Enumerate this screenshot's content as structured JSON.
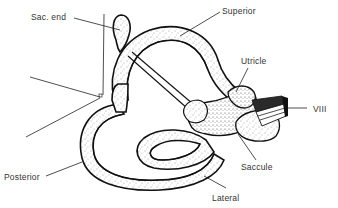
{
  "diagram": {
    "colors": {
      "ink": "#111111",
      "label": "#333333",
      "background": "#ffffff"
    },
    "labels": {
      "sac_end": "Sac. end",
      "superior": "Superior",
      "utricle": "Utricle",
      "viii": "VIII",
      "saccule": "Saccule",
      "lateral": "Lateral",
      "posterior": "Posterior"
    }
  }
}
